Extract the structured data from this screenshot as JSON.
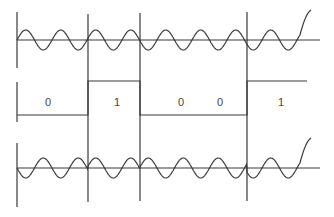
{
  "diagram": {
    "type": "phase-shift-keying",
    "colors": {
      "line": "#3a3a3a",
      "background": "#ffffff"
    },
    "carrier": {
      "axis_y": 40,
      "amplitude": 10,
      "period": 35,
      "x_start": 17,
      "x_end": 311
    },
    "binary": {
      "low_y": 115,
      "high_y": 81,
      "bits": [
        {
          "label": "0",
          "x0": 17,
          "x1": 88,
          "label_x": 48
        },
        {
          "label": "1",
          "x0": 88,
          "x1": 140,
          "label_x": 117
        },
        {
          "label": "0",
          "x0": 140,
          "x1": 200,
          "label_x": 181
        },
        {
          "label": "0",
          "x0": 200,
          "x1": 247,
          "label_x": 220
        },
        {
          "label": "1",
          "x0": 247,
          "x1": 307,
          "label_x": 281
        }
      ]
    },
    "modulated": {
      "axis_y": 168,
      "amplitude": 10,
      "period": 35
    },
    "boundaries_x": [
      17,
      88,
      140,
      247
    ]
  }
}
